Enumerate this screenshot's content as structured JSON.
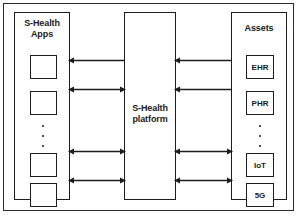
{
  "diagram": {
    "stroke_color": "#1d1d1d",
    "background_color": "#ffffff",
    "left_panel": {
      "title_line1": "S-Health",
      "title_line2": "Apps",
      "boxes": [
        {
          "label": ""
        },
        {
          "label": ""
        },
        {
          "label": ""
        },
        {
          "label": ""
        }
      ],
      "ellipsis": "⋮"
    },
    "center_panel": {
      "title_line1": "S-Health",
      "title_line2": "platform"
    },
    "right_panel": {
      "title": "Assets",
      "boxes": [
        {
          "label": "EHR"
        },
        {
          "label": "PHR"
        },
        {
          "label": "IoT"
        },
        {
          "label": "5G"
        }
      ],
      "ellipsis": "⋮"
    },
    "connectors": [
      {
        "id": "left-1",
        "side": "left",
        "direction": "left",
        "y": 61
      },
      {
        "id": "left-2",
        "side": "left",
        "direction": "both",
        "y": 90
      },
      {
        "id": "left-3",
        "side": "left",
        "direction": "both",
        "y": 152
      },
      {
        "id": "left-4",
        "side": "left",
        "direction": "both",
        "y": 181
      },
      {
        "id": "right-1",
        "side": "right",
        "direction": "left",
        "y": 61
      },
      {
        "id": "right-2",
        "side": "right",
        "direction": "left",
        "y": 90
      },
      {
        "id": "right-3",
        "side": "right",
        "direction": "both",
        "y": 152
      },
      {
        "id": "right-4",
        "side": "right",
        "direction": "both",
        "y": 181
      }
    ]
  }
}
